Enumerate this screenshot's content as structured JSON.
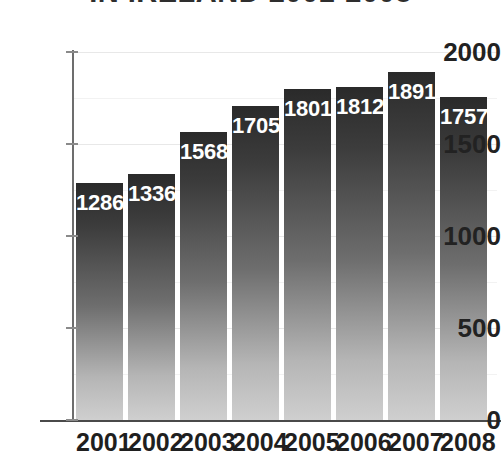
{
  "chart_data": {
    "type": "bar",
    "title": "IN IRELAND 2001-2008",
    "xlabel": "",
    "ylabel": "",
    "categories": [
      "2001",
      "2002",
      "2003",
      "2004",
      "2005",
      "2006",
      "2007",
      "2008"
    ],
    "values": [
      1286,
      1336,
      1568,
      1705,
      1801,
      1812,
      1891,
      1757
    ],
    "value_labels": [
      "1286",
      "1336",
      "1568",
      "1705",
      "1801",
      "1812",
      "1891",
      "1757*"
    ],
    "ylim": [
      0,
      2000
    ],
    "ytick_labels": [
      "2000",
      "1500",
      "1000",
      "500",
      "0"
    ],
    "ytick_values": [
      2000,
      1500,
      1000,
      500,
      0
    ],
    "grid": true,
    "legend": null,
    "bar_color_top": "#2a2a2a",
    "bar_color_bottom": "#cfcfcf",
    "label_color": "#ffffff",
    "axis_color": "#4a4a4a",
    "gridline_color": "#e8e8e8",
    "annotation": "*"
  }
}
